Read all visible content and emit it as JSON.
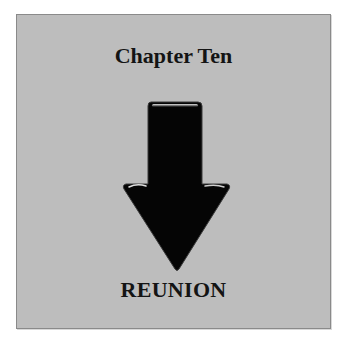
{
  "page": {
    "title": "Chapter Ten",
    "subtitle": "REUNION",
    "icon": "down-arrow-icon"
  },
  "colors": {
    "background": "#bdbdbd",
    "border": "#8a8a8a",
    "arrow": "#000000",
    "text": "#141414"
  }
}
